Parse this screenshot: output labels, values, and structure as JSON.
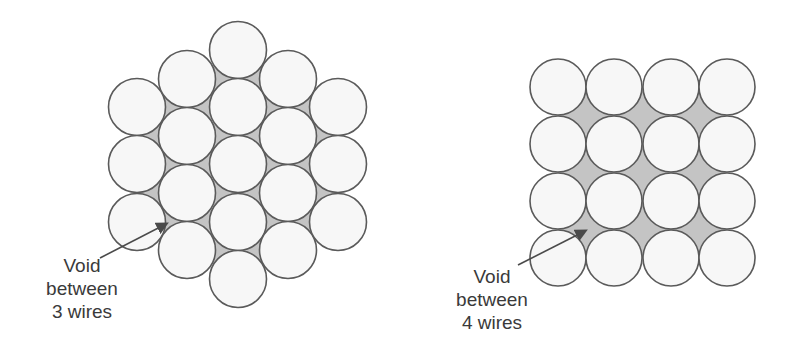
{
  "figure": {
    "left": {
      "title": "Hexagonal packing (19 wires)",
      "label_lines": [
        "Void",
        "between",
        "3 wires"
      ],
      "radius": 28.5,
      "columns": [
        {
          "x": 137,
          "ys": [
            107,
            164,
            222
          ]
        },
        {
          "x": 187,
          "ys": [
            79,
            136,
            193,
            250
          ]
        },
        {
          "x": 238,
          "ys": [
            50,
            107,
            164,
            222,
            279
          ]
        },
        {
          "x": 288,
          "ys": [
            79,
            136,
            193,
            250
          ]
        },
        {
          "x": 338,
          "ys": [
            107,
            164,
            222
          ]
        }
      ],
      "arrow": {
        "x1": 100,
        "y1": 258,
        "x2": 166,
        "y2": 224
      }
    },
    "right": {
      "title": "Square packing (16 wires)",
      "label_lines": [
        "Void",
        "between",
        "4 wires"
      ],
      "radius": 28,
      "xs": [
        558,
        614,
        671,
        727
      ],
      "ys": [
        87,
        144,
        201,
        258
      ],
      "arrow": {
        "x1": 518,
        "y1": 265,
        "x2": 585,
        "y2": 231
      }
    },
    "colors": {
      "circle_fill": "#f7f7f7",
      "circle_stroke": "#5a5a5a",
      "void_fill": "#c4c4c4",
      "arrow": "#4a4a4a",
      "text": "#3a3a3a"
    }
  }
}
